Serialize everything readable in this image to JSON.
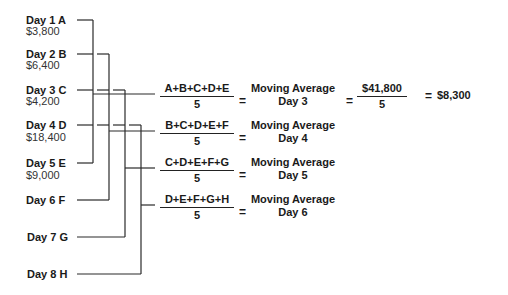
{
  "days": [
    {
      "label": "Day 1 A",
      "value": "$3,800"
    },
    {
      "label": "Day 2 B",
      "value": "$6,400"
    },
    {
      "label": "Day 3 C",
      "value": "$4,200"
    },
    {
      "label": "Day 4 D",
      "value": "$18,400"
    },
    {
      "label": "Day 5 E",
      "value": "$9,000"
    },
    {
      "label": "Day 6 F",
      "value": ""
    },
    {
      "label": "Day 7 G",
      "value": ""
    },
    {
      "label": "Day 8 H",
      "value": ""
    }
  ],
  "formulas": [
    {
      "numerator": "A+B+C+D+E",
      "denominator": "5",
      "equals": "=",
      "result_line1": "Moving Average",
      "result_line2": "Day 3"
    },
    {
      "numerator": "B+C+D+E+F",
      "denominator": "5",
      "equals": "=",
      "result_line1": "Moving Average",
      "result_line2": "Day 4"
    },
    {
      "numerator": "C+D+E+F+G",
      "denominator": "5",
      "equals": "=",
      "result_line1": "Moving Average",
      "result_line2": "Day 5"
    },
    {
      "numerator": "D+E+F+G+H",
      "denominator": "5",
      "equals": "=",
      "result_line1": "Moving Average",
      "result_line2": "Day 6"
    }
  ],
  "calculation": {
    "equals1": "=",
    "numerator": "$41,800",
    "denominator": "5",
    "equals2": "=",
    "result": "$8,300"
  }
}
